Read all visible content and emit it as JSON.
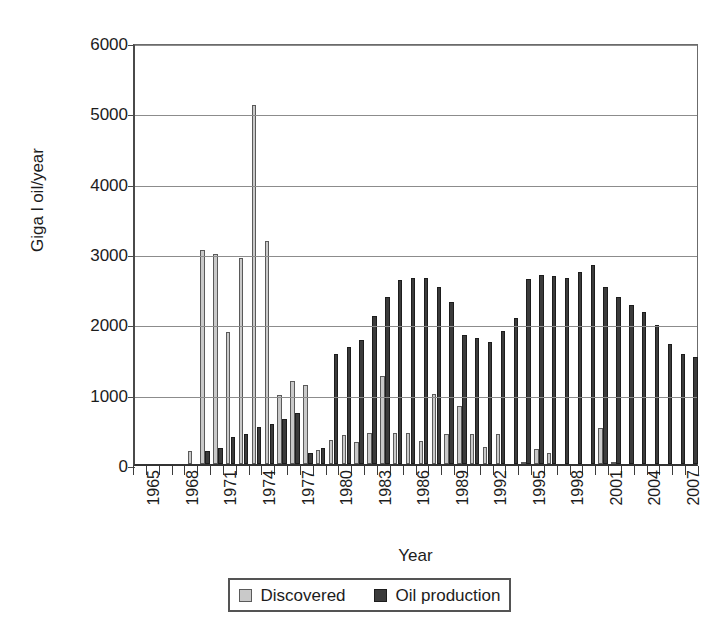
{
  "chart_data": {
    "type": "bar",
    "title": "",
    "xlabel": "Year",
    "ylabel": "Giga l oil/year",
    "ylim": [
      0,
      6000
    ],
    "ytick_step": 1000,
    "yticks": [
      0,
      1000,
      2000,
      3000,
      4000,
      5000,
      6000
    ],
    "ytick_labels": [
      "0",
      "1000",
      "2000",
      "3000",
      "4000",
      "5000",
      "6000"
    ],
    "grid": true,
    "grid_axis": "y",
    "legend_position": "below-axis",
    "xlim": [
      1965,
      2008
    ],
    "xtick_labels": [
      "1965",
      "1968",
      "1971",
      "1974",
      "1977",
      "1980",
      "1983",
      "1986",
      "1989",
      "1992",
      "1995",
      "1998",
      "2001",
      "2004",
      "2007"
    ],
    "xtick_label_step": 3,
    "xtick_label_rotation": 90,
    "categories": [
      "1965",
      "1966",
      "1967",
      "1968",
      "1969",
      "1970",
      "1971",
      "1972",
      "1973",
      "1974",
      "1975",
      "1976",
      "1977",
      "1978",
      "1979",
      "1980",
      "1981",
      "1982",
      "1983",
      "1984",
      "1985",
      "1986",
      "1987",
      "1988",
      "1989",
      "1990",
      "1991",
      "1992",
      "1993",
      "1994",
      "1995",
      "1996",
      "1997",
      "1998",
      "1999",
      "2000",
      "2001",
      "2002",
      "2003",
      "2004",
      "2005",
      "2006",
      "2007",
      "2008"
    ],
    "series": [
      {
        "name": "Discovered",
        "color": "#c9c9c9",
        "values": [
          0,
          0,
          0,
          0,
          180,
          3040,
          2990,
          1880,
          2930,
          5110,
          3170,
          980,
          1180,
          1120,
          200,
          340,
          410,
          310,
          440,
          1250,
          440,
          440,
          330,
          1000,
          420,
          830,
          420,
          240,
          430,
          0,
          20,
          210,
          160,
          0,
          0,
          0,
          510,
          20,
          0,
          0,
          0,
          0,
          0,
          0
        ]
      },
      {
        "name": "Oil production",
        "color": "#3b3b3b",
        "values": [
          0,
          0,
          0,
          0,
          0,
          190,
          230,
          390,
          430,
          530,
          570,
          640,
          730,
          150,
          230,
          1570,
          1670,
          1760,
          2110,
          2370,
          2620,
          2650,
          2650,
          2510,
          2310,
          1840,
          1790,
          1740,
          1890,
          2080,
          2630,
          2690,
          2680,
          2650,
          2730,
          2830,
          2520,
          2370,
          2260,
          2160,
          1970,
          1710,
          1560,
          1520
        ]
      }
    ]
  },
  "legend": {
    "items": [
      {
        "label": "Discovered"
      },
      {
        "label": "Oil production"
      }
    ]
  },
  "axis": {
    "y_title": "Giga l oil/year",
    "x_title": "Year"
  }
}
